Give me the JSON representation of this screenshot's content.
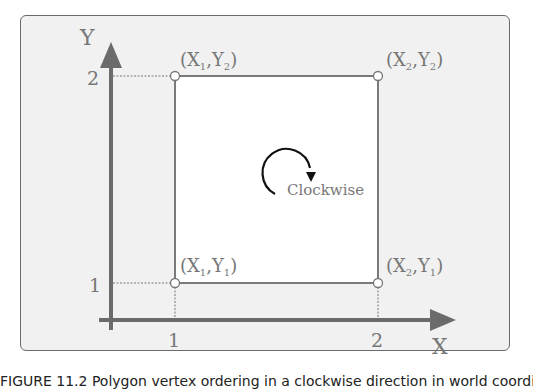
{
  "diagram": {
    "axes": {
      "x_label": "X",
      "y_label": "Y",
      "x_ticks": [
        "1",
        "2"
      ],
      "y_ticks": [
        "1",
        "2"
      ]
    },
    "corners": {
      "bottom_left": {
        "label": "(X",
        "sub1": "1",
        "mid": ",Y",
        "sub2": "1",
        "end": ")"
      },
      "bottom_right": {
        "label": "(X",
        "sub1": "2",
        "mid": ",Y",
        "sub2": "1",
        "end": ")"
      },
      "top_left": {
        "label": "(X",
        "sub1": "1",
        "mid": ",Y",
        "sub2": "2",
        "end": ")"
      },
      "top_right": {
        "label": "(X",
        "sub1": "2",
        "mid": ",Y",
        "sub2": "2",
        "end": ")"
      }
    },
    "rotation_label": "Clockwise",
    "colors": {
      "panel_bg": "#f1f1f1",
      "axis": "#6b6b6b",
      "rect_stroke": "#7a7a7a",
      "rect_fill": "#ffffff",
      "text": "#777777",
      "arrow": "#111111"
    }
  },
  "caption": "FIGURE 11.2  Polygon vertex ordering in a clockwise direction in world coordinates..."
}
